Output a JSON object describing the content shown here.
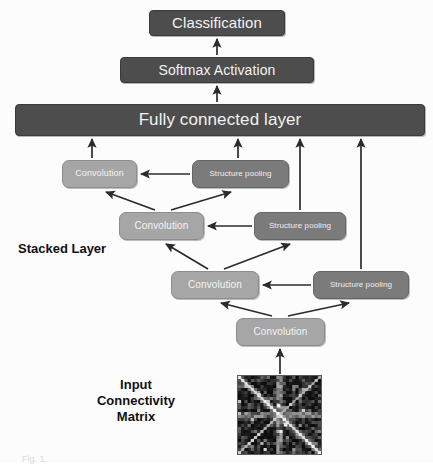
{
  "figure": {
    "background_color": "#fcfcfc",
    "caption_fragment": "Fig. 1."
  },
  "colors": {
    "dark_box": "#4d4d4d",
    "convolution_box": "#a6a6a6",
    "pooling_box": "#7b7b7b",
    "box_text": "#f2f2f2",
    "label_text": "#111111",
    "arrow": "#2b2b2b"
  },
  "nodes": {
    "classification": {
      "label": "Classification",
      "x": 149,
      "y": 10,
      "w": 136,
      "h": 26,
      "font_size": 15,
      "style": "dark"
    },
    "softmax": {
      "label": "Softmax Activation",
      "x": 120,
      "y": 57,
      "w": 194,
      "h": 26,
      "font_size": 14,
      "style": "dark"
    },
    "fully_connected": {
      "label": "Fully connected layer",
      "x": 15,
      "y": 104,
      "w": 410,
      "h": 32,
      "font_size": 17,
      "style": "dark"
    },
    "conv_row1": {
      "label": "Convolution",
      "x": 62,
      "y": 160,
      "w": 75,
      "h": 28,
      "font_size": 9,
      "style": "conv"
    },
    "pool_row1": {
      "label": "Structure pooling",
      "x": 192,
      "y": 160,
      "w": 97,
      "h": 28,
      "font_size": 8,
      "style": "pool"
    },
    "conv_row2": {
      "label": "Convolution",
      "x": 119,
      "y": 212,
      "w": 85,
      "h": 28,
      "font_size": 10,
      "style": "conv"
    },
    "pool_row2": {
      "label": "Structure pooling",
      "x": 254,
      "y": 212,
      "w": 92,
      "h": 28,
      "font_size": 8,
      "style": "pool"
    },
    "conv_row3": {
      "label": "Convolution",
      "x": 171,
      "y": 271,
      "w": 88,
      "h": 28,
      "font_size": 10,
      "style": "conv"
    },
    "pool_row3": {
      "label": "Structure pooling",
      "x": 313,
      "y": 271,
      "w": 96,
      "h": 28,
      "font_size": 8,
      "style": "pool"
    },
    "conv_row4": {
      "label": "Convolution",
      "x": 236,
      "y": 318,
      "w": 89,
      "h": 28,
      "font_size": 10,
      "style": "conv"
    }
  },
  "labels": {
    "stacked_layer": {
      "text": "Stacked Layer",
      "x": 18,
      "y": 241,
      "font_size": 13
    },
    "input_matrix": {
      "text": "Input\nConnectivity\nMatrix",
      "x": 62,
      "y": 377,
      "w": 148,
      "font_size": 13
    }
  },
  "matrix_image": {
    "name": "input-connectivity-matrix",
    "x": 237,
    "y": 375,
    "w": 85,
    "h": 80,
    "description": "Dark grayscale connectivity matrix heatmap with bright diagonal"
  },
  "flow": {
    "description": "Stacked convolution and structure pooling layers feed a fully connected layer, then softmax activation, then classification.",
    "edges": [
      {
        "from": "input_matrix",
        "to": "conv_row4",
        "kind": "vertical"
      },
      {
        "from": "conv_row4",
        "to": "conv_row3",
        "kind": "diagonal"
      },
      {
        "from": "conv_row4",
        "to": "pool_row3",
        "kind": "diagonal"
      },
      {
        "from": "pool_row3",
        "to": "conv_row3",
        "kind": "horizontal"
      },
      {
        "from": "conv_row3",
        "to": "conv_row2",
        "kind": "diagonal"
      },
      {
        "from": "conv_row3",
        "to": "pool_row2",
        "kind": "diagonal"
      },
      {
        "from": "pool_row2",
        "to": "conv_row2",
        "kind": "horizontal"
      },
      {
        "from": "conv_row2",
        "to": "conv_row1",
        "kind": "diagonal"
      },
      {
        "from": "conv_row2",
        "to": "pool_row1",
        "kind": "diagonal"
      },
      {
        "from": "pool_row1",
        "to": "conv_row1",
        "kind": "horizontal"
      },
      {
        "from": "conv_row1",
        "to": "fully_connected",
        "kind": "vertical"
      },
      {
        "from": "pool_row1",
        "to": "fully_connected",
        "kind": "vertical"
      },
      {
        "from": "pool_row2",
        "to": "fully_connected",
        "kind": "vertical"
      },
      {
        "from": "pool_row3",
        "to": "fully_connected",
        "kind": "vertical"
      },
      {
        "from": "fully_connected",
        "to": "softmax",
        "kind": "vertical"
      },
      {
        "from": "softmax",
        "to": "classification",
        "kind": "vertical"
      }
    ]
  }
}
